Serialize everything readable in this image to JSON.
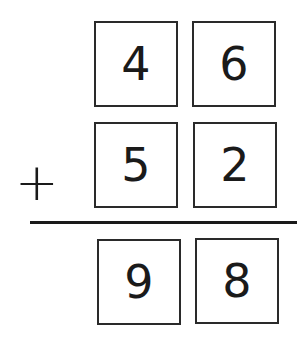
{
  "problem": {
    "operator": "+",
    "addend1": {
      "tens": "4",
      "ones": "6"
    },
    "addend2": {
      "tens": "5",
      "ones": "2"
    },
    "sum": {
      "tens": "9",
      "ones": "8"
    }
  }
}
